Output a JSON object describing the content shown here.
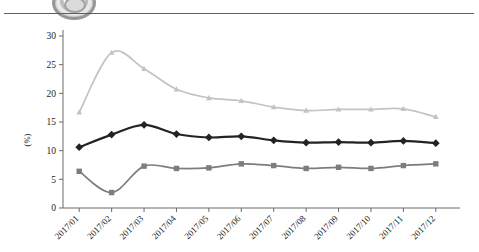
{
  "header": {
    "logo_icon": "circular-seal-icon",
    "divider": "horizontal-rule"
  },
  "chart_data": {
    "type": "line",
    "title": "",
    "subtitle": "",
    "xlabel": "",
    "ylabel": "(%)",
    "ylim": [
      0,
      30
    ],
    "ytick_values": [
      0,
      5,
      10,
      15,
      20,
      25,
      30
    ],
    "ytick_labels": [
      "0",
      "5",
      "10",
      "15",
      "20",
      "25",
      "30"
    ],
    "grid": false,
    "legend_position": "none",
    "categories": [
      "2017/01",
      "2017/02",
      "2017/03",
      "2017/04",
      "2017/05",
      "2017/06",
      "2017/07",
      "2017/08",
      "2017/09",
      "2017/10",
      "2017/11",
      "2017/12"
    ],
    "series": [
      {
        "name": "series-light-gray",
        "marker": "triangle",
        "color": "#c3c3c3",
        "values": [
          16.7,
          27.1,
          24.3,
          20.7,
          19.2,
          18.7,
          17.6,
          17.0,
          17.2,
          17.2,
          17.3,
          15.9
        ]
      },
      {
        "name": "series-black",
        "marker": "diamond",
        "color": "#232323",
        "values": [
          10.6,
          12.8,
          14.5,
          12.9,
          12.3,
          12.5,
          11.8,
          11.4,
          11.5,
          11.4,
          11.7,
          11.3
        ]
      },
      {
        "name": "series-mid-gray",
        "marker": "square",
        "color": "#7d7d7d",
        "values": [
          6.4,
          2.7,
          7.3,
          6.9,
          7.0,
          7.7,
          7.4,
          6.9,
          7.1,
          6.9,
          7.4,
          7.7
        ]
      }
    ]
  },
  "colors": {
    "axis": "#6b6b6b",
    "text": "#1c1c1c",
    "rule": "#5d5d5d",
    "background": "#ffffff"
  }
}
